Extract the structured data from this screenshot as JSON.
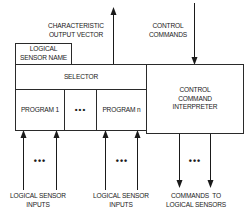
{
  "diagram": {
    "labels": {
      "characteristic_output_vector": [
        "CHARACTERISTIC",
        "OUTPUT VECTOR"
      ],
      "control_commands": [
        "CONTROL",
        "COMMANDS"
      ],
      "logical_sensor_inputs_left": [
        "LOGICAL SENSOR",
        "INPUTS"
      ],
      "logical_sensor_inputs_right": [
        "LOGICAL SENSOR",
        "INPUTS"
      ],
      "commands_to_logical_sensors": [
        "COMMANDS  TO",
        "LOGICAL SENSORS"
      ]
    },
    "boxes": {
      "logical_sensor_name": [
        "LOGICAL",
        "SENSOR NAME"
      ],
      "selector": "SELECTOR",
      "program_1": "PROGRAM 1",
      "program_ellipsis": "•••",
      "program_n": "PROGRAM n",
      "control_command_interpreter": [
        "CONTROL",
        "COMMAND",
        "INTERPRETER"
      ]
    },
    "ellipses": {
      "inputs_left": "•••",
      "inputs_right": "•••",
      "commands_out": "•••"
    },
    "colors": {
      "line": "#2a2a2a",
      "background": "#ffffff"
    }
  }
}
